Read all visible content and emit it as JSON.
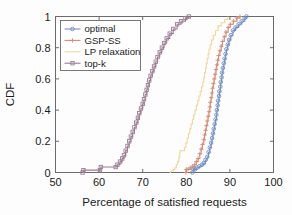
{
  "chart_data": {
    "type": "line",
    "title": "",
    "xlabel": "Percentage of satisfied requests",
    "ylabel": "CDF",
    "xlim": [
      50,
      100
    ],
    "ylim": [
      0,
      1
    ],
    "xticks": [
      50,
      60,
      70,
      80,
      90,
      100
    ],
    "xticklabels": [
      "50",
      "60",
      "70",
      "80",
      "90",
      "100"
    ],
    "yticks": [
      0,
      0.2,
      0.4,
      0.6,
      0.8,
      1
    ],
    "yticklabels": [
      "0",
      "0.2",
      "0.4",
      "0.6",
      "0.8",
      "1"
    ],
    "grid": false,
    "legend_position": "upper left",
    "series": [
      {
        "name": "optimal",
        "color": "#6f8fc4",
        "marker": "circle",
        "points": [
          [
            81.4,
            0.0
          ],
          [
            81.6,
            0.02
          ],
          [
            82.0,
            0.02
          ],
          [
            82.4,
            0.03
          ],
          [
            83.0,
            0.04
          ],
          [
            83.6,
            0.05
          ],
          [
            84.0,
            0.06
          ],
          [
            84.4,
            0.08
          ],
          [
            84.8,
            0.1
          ],
          [
            85.1,
            0.13
          ],
          [
            85.4,
            0.16
          ],
          [
            85.7,
            0.19
          ],
          [
            85.9,
            0.22
          ],
          [
            86.1,
            0.25
          ],
          [
            86.3,
            0.28
          ],
          [
            86.5,
            0.31
          ],
          [
            86.7,
            0.34
          ],
          [
            86.9,
            0.37
          ],
          [
            87.0,
            0.4
          ],
          [
            87.2,
            0.43
          ],
          [
            87.3,
            0.46
          ],
          [
            87.5,
            0.49
          ],
          [
            87.6,
            0.52
          ],
          [
            87.8,
            0.55
          ],
          [
            87.9,
            0.58
          ],
          [
            88.1,
            0.61
          ],
          [
            88.2,
            0.64
          ],
          [
            88.4,
            0.67
          ],
          [
            88.6,
            0.7
          ],
          [
            88.8,
            0.73
          ],
          [
            89.0,
            0.76
          ],
          [
            89.2,
            0.79
          ],
          [
            89.5,
            0.82
          ],
          [
            89.8,
            0.85
          ],
          [
            90.2,
            0.88
          ],
          [
            90.7,
            0.91
          ],
          [
            91.3,
            0.93
          ],
          [
            92.0,
            0.95
          ],
          [
            92.7,
            0.97
          ],
          [
            93.4,
            0.99
          ],
          [
            93.8,
            1.0
          ]
        ]
      },
      {
        "name": "GSP-SS",
        "color": "#d98a72",
        "marker": "plus",
        "points": [
          [
            79.9,
            0.0
          ],
          [
            80.0,
            0.02
          ],
          [
            80.4,
            0.02
          ],
          [
            80.9,
            0.03
          ],
          [
            81.4,
            0.04
          ],
          [
            81.9,
            0.05
          ],
          [
            82.3,
            0.07
          ],
          [
            82.7,
            0.09
          ],
          [
            83.1,
            0.12
          ],
          [
            83.4,
            0.15
          ],
          [
            83.7,
            0.18
          ],
          [
            84.0,
            0.21
          ],
          [
            84.2,
            0.24
          ],
          [
            84.4,
            0.27
          ],
          [
            84.6,
            0.3
          ],
          [
            84.8,
            0.33
          ],
          [
            85.0,
            0.36
          ],
          [
            85.2,
            0.39
          ],
          [
            85.4,
            0.42
          ],
          [
            85.5,
            0.45
          ],
          [
            85.7,
            0.48
          ],
          [
            85.9,
            0.51
          ],
          [
            86.0,
            0.54
          ],
          [
            86.2,
            0.57
          ],
          [
            86.4,
            0.6
          ],
          [
            86.6,
            0.63
          ],
          [
            86.8,
            0.66
          ],
          [
            87.0,
            0.69
          ],
          [
            87.2,
            0.72
          ],
          [
            87.4,
            0.75
          ],
          [
            87.7,
            0.78
          ],
          [
            88.0,
            0.81
          ],
          [
            88.3,
            0.84
          ],
          [
            88.7,
            0.87
          ],
          [
            89.1,
            0.9
          ],
          [
            89.6,
            0.93
          ],
          [
            90.1,
            0.95
          ],
          [
            90.8,
            0.97
          ],
          [
            91.6,
            0.99
          ],
          [
            92.3,
            1.0
          ]
        ]
      },
      {
        "name": "LP relaxation",
        "color": "#f0d79a",
        "marker": "none",
        "points": [
          [
            76.2,
            0.0
          ],
          [
            76.4,
            0.01
          ],
          [
            77.0,
            0.02
          ],
          [
            77.4,
            0.03
          ],
          [
            77.7,
            0.05
          ],
          [
            78.0,
            0.07
          ],
          [
            78.3,
            0.1
          ],
          [
            78.5,
            0.13
          ],
          [
            78.6,
            0.14
          ],
          [
            79.5,
            0.14
          ],
          [
            79.6,
            0.16
          ],
          [
            79.9,
            0.19
          ],
          [
            80.2,
            0.22
          ],
          [
            80.5,
            0.25
          ],
          [
            80.8,
            0.28
          ],
          [
            81.1,
            0.31
          ],
          [
            81.4,
            0.34
          ],
          [
            81.7,
            0.37
          ],
          [
            82.0,
            0.4
          ],
          [
            82.3,
            0.43
          ],
          [
            82.6,
            0.46
          ],
          [
            82.9,
            0.49
          ],
          [
            83.2,
            0.52
          ],
          [
            83.5,
            0.55
          ],
          [
            83.8,
            0.58
          ],
          [
            84.0,
            0.61
          ],
          [
            84.2,
            0.64
          ],
          [
            84.4,
            0.67
          ],
          [
            84.6,
            0.7
          ],
          [
            84.8,
            0.73
          ],
          [
            85.0,
            0.76
          ],
          [
            85.2,
            0.79
          ],
          [
            85.5,
            0.82
          ],
          [
            85.8,
            0.85
          ],
          [
            86.2,
            0.88
          ],
          [
            86.7,
            0.91
          ],
          [
            87.3,
            0.94
          ],
          [
            88.0,
            0.96
          ],
          [
            88.8,
            0.98
          ],
          [
            89.5,
            1.0
          ]
        ]
      },
      {
        "name": "top-k",
        "color": "#9d7d94",
        "marker": "square",
        "points": [
          [
            56.2,
            0.0
          ],
          [
            56.4,
            0.015
          ],
          [
            60.2,
            0.015
          ],
          [
            60.4,
            0.035
          ],
          [
            63.8,
            0.035
          ],
          [
            64.2,
            0.05
          ],
          [
            64.8,
            0.07
          ],
          [
            65.3,
            0.09
          ],
          [
            65.7,
            0.11
          ],
          [
            66.1,
            0.14
          ],
          [
            66.5,
            0.17
          ],
          [
            66.9,
            0.2
          ],
          [
            67.3,
            0.23
          ],
          [
            67.7,
            0.26
          ],
          [
            68.1,
            0.29
          ],
          [
            68.5,
            0.32
          ],
          [
            68.9,
            0.35
          ],
          [
            69.2,
            0.38
          ],
          [
            69.6,
            0.41
          ],
          [
            70.0,
            0.44
          ],
          [
            70.3,
            0.47
          ],
          [
            70.6,
            0.5
          ],
          [
            70.9,
            0.53
          ],
          [
            71.2,
            0.56
          ],
          [
            71.5,
            0.59
          ],
          [
            71.8,
            0.62
          ],
          [
            72.2,
            0.65
          ],
          [
            72.6,
            0.68
          ],
          [
            73.0,
            0.71
          ],
          [
            73.4,
            0.74
          ],
          [
            73.9,
            0.77
          ],
          [
            74.4,
            0.8
          ],
          [
            74.9,
            0.83
          ],
          [
            75.5,
            0.86
          ],
          [
            76.2,
            0.89
          ],
          [
            77.0,
            0.92
          ],
          [
            77.9,
            0.95
          ],
          [
            78.8,
            0.97
          ],
          [
            79.8,
            0.99
          ],
          [
            80.6,
            1.0
          ]
        ]
      }
    ]
  },
  "legend": {
    "entries": [
      {
        "label": "optimal"
      },
      {
        "label": "GSP-SS"
      },
      {
        "label": "LP relaxation"
      },
      {
        "label": "top-k"
      }
    ]
  }
}
